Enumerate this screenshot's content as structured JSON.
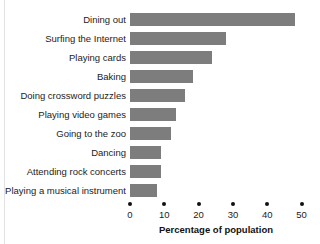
{
  "chart_data": {
    "type": "bar",
    "orientation": "horizontal",
    "title": "",
    "xlabel": "Percentage of population",
    "ylabel": "",
    "xlim": [
      0,
      50
    ],
    "xticks": [
      0,
      10,
      20,
      30,
      40,
      50
    ],
    "xtick_labels": [
      "0",
      "10",
      "20",
      "30",
      "40",
      "50"
    ],
    "grid": false,
    "legend": false,
    "bar_color": "#7d7d7d",
    "categories": [
      "Dining out",
      "Surfing the Internet",
      "Playing cards",
      "Baking",
      "Doing crossword puzzles",
      "Playing video games",
      "Going to the zoo",
      "Dancing",
      "Attending rock concerts",
      "Playing a musical instrument"
    ],
    "values": [
      48,
      28,
      24,
      18.5,
      16,
      13.5,
      12,
      9,
      9,
      8
    ],
    "bars": [
      {
        "label": "Dining out",
        "value": 48
      },
      {
        "label": "Surfing the Internet",
        "value": 28
      },
      {
        "label": "Playing cards",
        "value": 24
      },
      {
        "label": "Baking",
        "value": 18.5
      },
      {
        "label": "Doing crossword puzzles",
        "value": 16
      },
      {
        "label": "Playing video games",
        "value": 13.5
      },
      {
        "label": "Going to the zoo",
        "value": 12
      },
      {
        "label": "Dancing",
        "value": 9
      },
      {
        "label": "Attending rock concerts",
        "value": 9
      },
      {
        "label": "Playing a musical instrument",
        "value": 8
      }
    ]
  }
}
